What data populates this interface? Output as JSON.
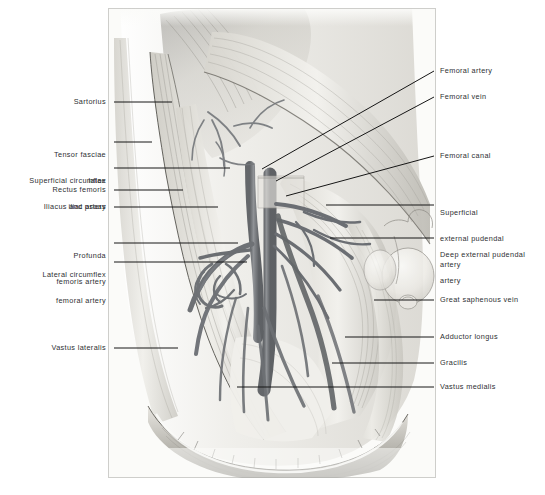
{
  "plate": {
    "title": "Femoral triangle dissection",
    "description": "Grayscale anatomical halftone drawing of the right femoral triangle showing femoral artery, femoral vein and surrounding thigh musculature",
    "background_color": "#fbfbf9",
    "ink_color": "#4a4d52"
  },
  "labels_left": [
    {
      "text": "Sartorius",
      "lines": [
        "Sartorius"
      ]
    },
    {
      "text": "Tensor fasciae latae",
      "lines": [
        "Tensor fasciae",
        "latae"
      ]
    },
    {
      "text": "Superficial circumflex iliac artery",
      "lines": [
        "Superficial circumflex",
        "iliac artery"
      ]
    },
    {
      "text": "Rectus femoris",
      "lines": [
        "Rectus femoris"
      ]
    },
    {
      "text": "Iliacus and psoas",
      "lines": [
        "Iliacus and psoas"
      ]
    },
    {
      "text": "Profunda femoris artery",
      "lines": [
        "Profunda",
        "femoris artery"
      ]
    },
    {
      "text": "Lateral circumflex femoral artery",
      "lines": [
        "Lateral circumflex",
        "femoral artery"
      ]
    },
    {
      "text": "Vastus lateralis",
      "lines": [
        "Vastus lateralis"
      ]
    }
  ],
  "labels_right": [
    {
      "text": "Femoral artery",
      "lines": [
        "Femoral artery"
      ]
    },
    {
      "text": "Femoral vein",
      "lines": [
        "Femoral vein"
      ]
    },
    {
      "text": "Femoral canal",
      "lines": [
        "Femoral canal"
      ]
    },
    {
      "text": "Superficial external pudendal artery",
      "lines": [
        "Superficial",
        "external pudendal",
        "artery"
      ]
    },
    {
      "text": "Deep external pudendal artery",
      "lines": [
        "Deep external pudendal",
        "artery"
      ]
    },
    {
      "text": "Great saphenous vein",
      "lines": [
        "Great saphenous vein"
      ]
    },
    {
      "text": "Adductor longus",
      "lines": [
        "Adductor longus"
      ]
    },
    {
      "text": "Gracilis",
      "lines": [
        "Gracilis"
      ]
    },
    {
      "text": "Vastus medialis",
      "lines": [
        "Vastus medialis"
      ]
    }
  ]
}
